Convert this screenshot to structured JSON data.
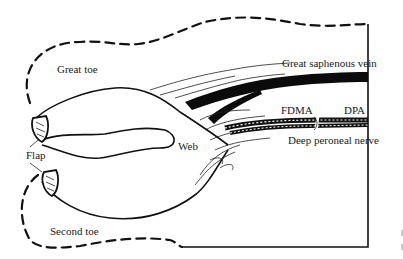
{
  "figure": {
    "type": "anatomical-diagram",
    "labels": {
      "great_toe": "Great toe",
      "second_toe": "Second toe",
      "flap": "Flap",
      "web": "Web",
      "great_saphenous_vein": "Great saphenous vein",
      "fdma": "FDMA",
      "dpa": "DPA",
      "deep_peroneal_nerve": "Deep peroneal nerve"
    },
    "colors": {
      "ink": "#111111",
      "background": "#ffffff"
    }
  }
}
